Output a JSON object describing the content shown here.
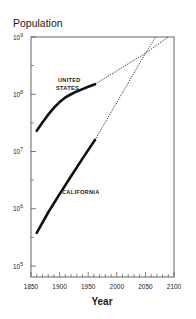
{
  "chart_data": {
    "type": "line",
    "title": "Population",
    "xlabel": "Year",
    "ylabel": "Population",
    "yscale": "log",
    "xlim": [
      1850,
      2100
    ],
    "ylim": [
      100000,
      1000000000
    ],
    "x_ticks": [
      1850,
      1900,
      1950,
      2000,
      2050,
      2100
    ],
    "y_ticks": [
      {
        "base": "10",
        "exp": "5",
        "value": 100000
      },
      {
        "base": "10",
        "exp": "6",
        "value": 1000000
      },
      {
        "base": "10",
        "exp": "7",
        "value": 10000000
      },
      {
        "base": "10",
        "exp": "8",
        "value": 100000000
      },
      {
        "base": "10",
        "exp": "9",
        "value": 1000000000
      }
    ],
    "grid": false,
    "legend": "inline labels",
    "series": [
      {
        "name": "UNITED STATES",
        "label_lines": [
          "UNITED",
          "STATES"
        ],
        "style": "solid",
        "points": [
          [
            1860,
            23000000
          ],
          [
            1870,
            32000000
          ],
          [
            1880,
            44000000
          ],
          [
            1890,
            58000000
          ],
          [
            1900,
            73000000
          ],
          [
            1910,
            88000000
          ],
          [
            1920,
            100000000
          ],
          [
            1930,
            112000000
          ],
          [
            1940,
            123000000
          ],
          [
            1950,
            135000000
          ],
          [
            1962,
            150000000
          ]
        ],
        "projection": {
          "style": "dotted",
          "points": [
            [
              1962,
              150000000
            ],
            [
              2050,
              520000000
            ],
            [
              2090,
              1000000000
            ]
          ]
        }
      },
      {
        "name": "CALIFORNIA",
        "label_lines": [
          "CALIFORNIA"
        ],
        "style": "solid",
        "points": [
          [
            1860,
            380000
          ],
          [
            1880,
            860000
          ],
          [
            1900,
            1800000
          ],
          [
            1920,
            3700000
          ],
          [
            1940,
            7500000
          ],
          [
            1962,
            16000000
          ]
        ],
        "projection": {
          "style": "dotted",
          "points": [
            [
              1962,
              16000000
            ],
            [
              2050,
              520000000
            ],
            [
              2068,
              1000000000
            ]
          ]
        }
      }
    ]
  }
}
